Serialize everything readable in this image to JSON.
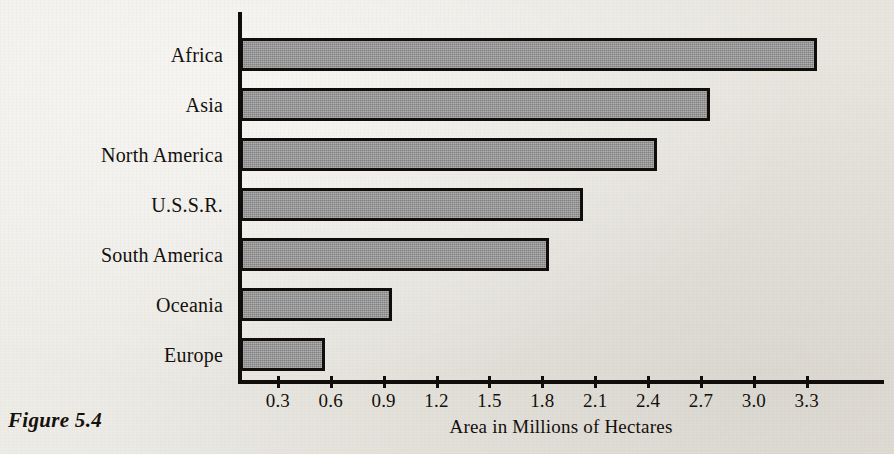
{
  "figure": {
    "caption": "Figure 5.4"
  },
  "chart_data": {
    "type": "bar",
    "orientation": "horizontal",
    "title": "",
    "subtitle": "",
    "xlabel": "Area in Millions of Hectares",
    "ylabel": "",
    "categories": [
      "Africa",
      "Asia",
      "North America",
      "U.S.S.R.",
      "South America",
      "Oceania",
      "Europe"
    ],
    "values": [
      3.36,
      2.75,
      2.45,
      2.03,
      1.84,
      0.95,
      0.57
    ],
    "xlim": [
      0,
      3.45
    ],
    "xticks": [
      0.3,
      0.6,
      0.9,
      1.2,
      1.5,
      1.8,
      2.1,
      2.4,
      2.7,
      3.0,
      3.3
    ],
    "xticklabels": [
      "0.3",
      "0.6",
      "0.9",
      "1.2",
      "1.5",
      "1.8",
      "2.1",
      "2.4",
      "2.7",
      "3.0",
      "3.3"
    ],
    "grid": false,
    "legend": null,
    "bar_fill_color": "#8d8d8d",
    "bar_edge_color": "#100d0a",
    "background_color": "#eceae5",
    "text_color": "#14100c"
  }
}
